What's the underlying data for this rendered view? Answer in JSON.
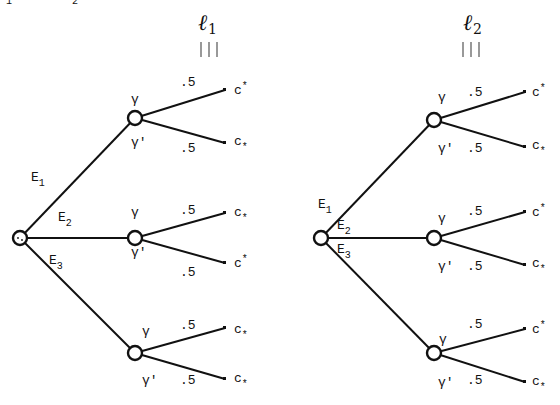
{
  "header": {
    "cropped_top_text": [
      "1",
      "2"
    ]
  },
  "trees": [
    {
      "id": "l1",
      "title": "ℓ",
      "title_sub": "1",
      "equiv_symbol": "|||",
      "root": {
        "x": 20,
        "y": 238
      },
      "events": [
        {
          "label": "E",
          "sub": "1"
        },
        {
          "label": "E",
          "sub": "2"
        },
        {
          "label": "E",
          "sub": "3"
        }
      ],
      "branches": [
        {
          "node": {
            "x": 135,
            "y": 118
          },
          "upper_state": "γ",
          "lower_state": "γ'",
          "upper_prob": ".5",
          "lower_prob": ".5",
          "upper_outcome": {
            "base": "c",
            "mark": "*",
            "pos": "sup"
          },
          "lower_outcome": {
            "base": "c",
            "mark": "*",
            "pos": "sub"
          }
        },
        {
          "node": {
            "x": 135,
            "y": 238
          },
          "upper_state": "γ",
          "lower_state": "γ'",
          "upper_prob": ".5",
          "lower_prob": ".5",
          "upper_outcome": {
            "base": "c",
            "mark": "*",
            "pos": "sub"
          },
          "lower_outcome": {
            "base": "c",
            "mark": "*",
            "pos": "sup"
          }
        },
        {
          "node": {
            "x": 135,
            "y": 353
          },
          "upper_state": "γ",
          "lower_state": "γ'",
          "upper_prob": ".5",
          "lower_prob": ".5",
          "upper_outcome": {
            "base": "c",
            "mark": "*",
            "pos": "sub"
          },
          "lower_outcome": {
            "base": "c",
            "mark": "*",
            "pos": "sub"
          }
        }
      ]
    },
    {
      "id": "l2",
      "title": "ℓ",
      "title_sub": "2",
      "equiv_symbol": "|||",
      "root": {
        "x": 321,
        "y": 238
      },
      "events": [
        {
          "label": "E",
          "sub": "1"
        },
        {
          "label": "E",
          "sub": "2"
        },
        {
          "label": "E",
          "sub": "3"
        }
      ],
      "branches": [
        {
          "node": {
            "x": 434,
            "y": 120
          },
          "upper_state": "γ",
          "lower_state": "γ'",
          "upper_prob": ".5",
          "lower_prob": ".5",
          "upper_outcome": {
            "base": "c",
            "mark": "*",
            "pos": "sup"
          },
          "lower_outcome": {
            "base": "c",
            "mark": "*",
            "pos": "sub"
          }
        },
        {
          "node": {
            "x": 434,
            "y": 238
          },
          "upper_state": "γ",
          "lower_state": "γ'",
          "upper_prob": ".5",
          "lower_prob": ".5",
          "upper_outcome": {
            "base": "c",
            "mark": "*",
            "pos": "sup"
          },
          "lower_outcome": {
            "base": "c",
            "mark": "*",
            "pos": "sub"
          }
        },
        {
          "node": {
            "x": 434,
            "y": 353
          },
          "upper_state": "γ",
          "lower_state": "γ'",
          "upper_prob": ".5",
          "lower_prob": ".5",
          "upper_outcome": {
            "base": "c",
            "mark": "*",
            "pos": "sup"
          },
          "lower_outcome": {
            "base": "c",
            "mark": "*",
            "pos": "sub"
          }
        }
      ]
    }
  ]
}
